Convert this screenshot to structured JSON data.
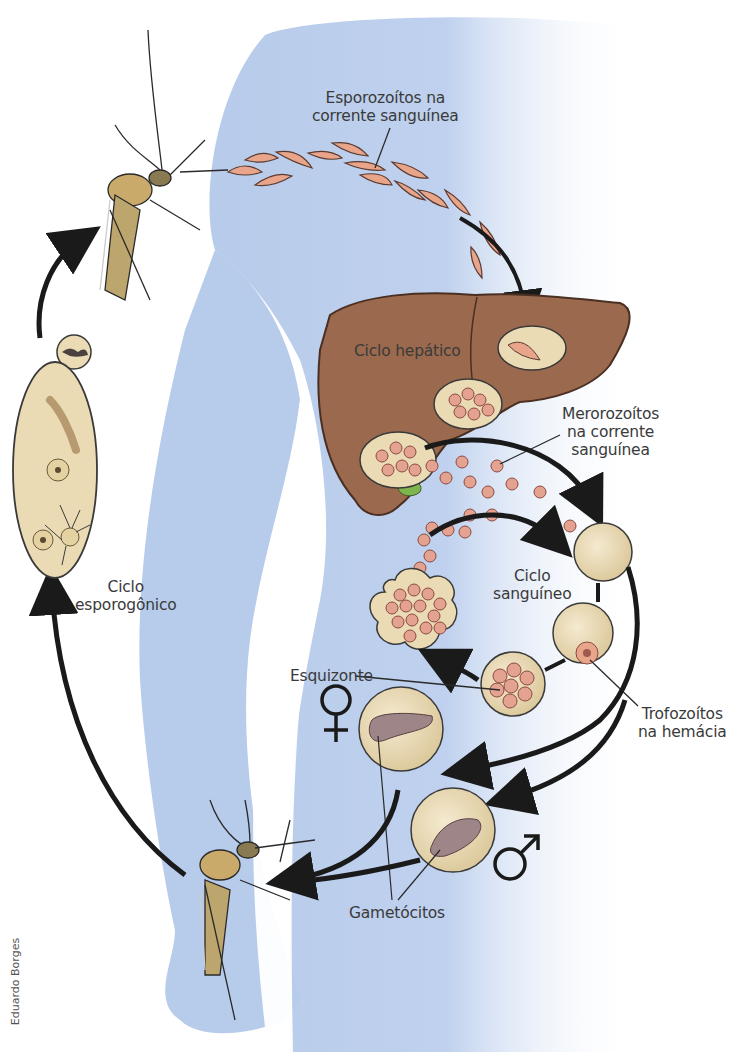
{
  "diagram": {
    "labels": {
      "sporozoites": "Esporozoítos na\ncorrente sanguínea",
      "sporozoites_line1": "Esporozoítos na",
      "sporozoites_line2": "corrente sanguínea",
      "hepatic_cycle": "Ciclo hepático",
      "merozoites_line1": "Merorozoítos",
      "merozoites_line2": "na corrente",
      "merozoites_line3": "sanguínea",
      "blood_cycle_line1": "Ciclo",
      "blood_cycle_line2": "sanguíneo",
      "sporogonic_cycle_line1": "Ciclo",
      "sporogonic_cycle_line2": "esporogônico",
      "schizont": "Esquizonte",
      "trophozoites_line1": "Trofozoítos",
      "trophozoites_line2": "na hemácia",
      "gametocytes": "Gametócitos"
    },
    "symbols": {
      "female": "♀",
      "male": "♂"
    },
    "credit": "Eduardo Borges",
    "colors": {
      "body_silhouette": "#b7cbea",
      "liver": "#9b6a4e",
      "liver_outline": "#4a2f22",
      "cell_fill": "#eadbb4",
      "parasite_pink": "#e8a58a",
      "merozoite_fill": "#e4a291",
      "merozoite_nucleus": "#a05a4e",
      "gametocyte_fill": "#9e8587",
      "gallbladder": "#7fb54f",
      "arrow": "#1a1a1a",
      "text": "#3a3a3a"
    }
  }
}
